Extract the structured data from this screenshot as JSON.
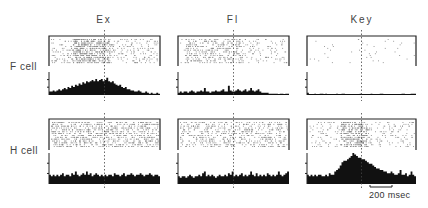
{
  "figure": {
    "columns": [
      {
        "label": "Ex",
        "x": 104
      },
      {
        "label": "Fl",
        "x": 233
      },
      {
        "label": "Key",
        "x": 362
      }
    ],
    "rows": [
      {
        "label": "F cell",
        "y": 61
      },
      {
        "label": "H cell",
        "y": 145
      }
    ],
    "scale_bar": {
      "label": "200 msec",
      "x1": 370,
      "x2": 392,
      "y": 187
    }
  },
  "chart_data": {
    "type": "bar",
    "title": "",
    "xlabel": "Time (scale bar 200 msec)",
    "ylabel": "Spike count (relative)",
    "columns": [
      "Ex",
      "Fl",
      "Key"
    ],
    "rows": [
      "F cell",
      "H cell"
    ],
    "annotations": [
      "200 msec"
    ],
    "panels": [
      {
        "row": "F cell",
        "column": "Ex",
        "raster_density": 0.55,
        "raster_focus": [
          0.2,
          0.55
        ],
        "histogram": [
          3,
          3,
          4,
          3,
          4,
          5,
          4,
          5,
          6,
          5,
          7,
          6,
          8,
          7,
          9,
          8,
          10,
          9,
          11,
          10,
          12,
          11,
          12,
          13,
          12,
          14,
          12,
          13,
          14,
          12,
          13,
          15,
          12,
          11,
          12,
          10,
          9,
          8,
          9,
          7,
          6,
          7,
          5,
          5,
          4,
          4,
          3,
          3,
          4,
          3,
          2,
          2,
          3,
          2,
          1,
          2,
          1,
          1,
          2,
          1
        ]
      },
      {
        "row": "F cell",
        "column": "Fl",
        "raster_density": 0.35,
        "raster_focus": [
          0.05,
          0.6
        ],
        "histogram": [
          2,
          3,
          2,
          3,
          3,
          2,
          3,
          4,
          3,
          2,
          3,
          3,
          4,
          3,
          6,
          3,
          3,
          2,
          3,
          3,
          4,
          3,
          3,
          4,
          5,
          3,
          3,
          8,
          4,
          3,
          3,
          4,
          5,
          4,
          3,
          4,
          5,
          3,
          4,
          6,
          4,
          3,
          4,
          5,
          3,
          2,
          2,
          2,
          2,
          1,
          1,
          1,
          1,
          1,
          0,
          1,
          1,
          0,
          1,
          1
        ]
      },
      {
        "row": "F cell",
        "column": "Key",
        "raster_density": 0.03,
        "raster_focus": [
          0.0,
          1.0
        ],
        "histogram": [
          2,
          0,
          0,
          0,
          1,
          0,
          0,
          1,
          1,
          0,
          1,
          0,
          0,
          0,
          0,
          0,
          1,
          0,
          0,
          1,
          1,
          0,
          0,
          0,
          0,
          0,
          0,
          0,
          0,
          1,
          0,
          0,
          0,
          0,
          0,
          1,
          0,
          0,
          0,
          0,
          1,
          1,
          0,
          0,
          0,
          0,
          0,
          0,
          0,
          0,
          0,
          0,
          1,
          1,
          0,
          0,
          0,
          1,
          1,
          1
        ]
      },
      {
        "row": "H cell",
        "column": "Ex",
        "raster_density": 0.6,
        "raster_focus": [
          0.0,
          1.0
        ],
        "histogram": [
          6,
          5,
          6,
          5,
          6,
          5,
          6,
          7,
          5,
          6,
          6,
          5,
          7,
          6,
          8,
          6,
          5,
          6,
          7,
          6,
          8,
          6,
          7,
          5,
          6,
          7,
          6,
          5,
          6,
          5,
          6,
          5,
          6,
          6,
          5,
          7,
          6,
          6,
          5,
          6,
          7,
          5,
          6,
          6,
          7,
          6,
          5,
          6,
          6,
          7,
          6,
          5,
          6,
          6,
          7,
          6,
          5,
          6,
          6,
          5
        ]
      },
      {
        "row": "H cell",
        "column": "Fl",
        "raster_density": 0.45,
        "raster_focus": [
          0.0,
          1.0
        ],
        "histogram": [
          5,
          4,
          5,
          5,
          4,
          5,
          6,
          5,
          4,
          5,
          5,
          6,
          5,
          7,
          8,
          5,
          6,
          5,
          6,
          5,
          4,
          5,
          6,
          5,
          5,
          6,
          5,
          7,
          6,
          8,
          5,
          6,
          5,
          6,
          7,
          5,
          6,
          5,
          6,
          8,
          6,
          5,
          7,
          5,
          6,
          5,
          6,
          5,
          7,
          6,
          5,
          6,
          5,
          6,
          8,
          6,
          5,
          6,
          7,
          8
        ]
      },
      {
        "row": "H cell",
        "column": "Key",
        "raster_density": 0.4,
        "raster_focus": [
          0.3,
          0.55
        ],
        "histogram": [
          6,
          5,
          6,
          5,
          6,
          5,
          6,
          6,
          5,
          5,
          6,
          5,
          7,
          6,
          6,
          8,
          9,
          10,
          12,
          14,
          15,
          15,
          16,
          17,
          18,
          20,
          19,
          18,
          17,
          17,
          16,
          16,
          15,
          14,
          13,
          13,
          12,
          11,
          10,
          10,
          9,
          9,
          8,
          8,
          7,
          7,
          8,
          7,
          6,
          6,
          7,
          9,
          6,
          6,
          7,
          5,
          6,
          8,
          6,
          5
        ]
      }
    ],
    "legend": [],
    "grid": false
  }
}
